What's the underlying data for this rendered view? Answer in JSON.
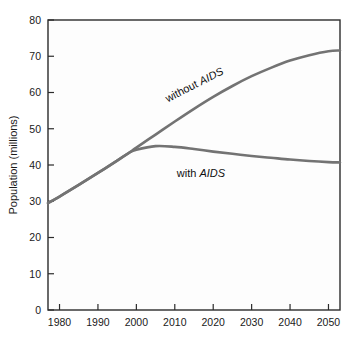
{
  "chart_data": {
    "type": "line",
    "title": "",
    "subtitle": "",
    "xlabel": "",
    "ylabel": "Population (millions)",
    "xlim": [
      1977,
      2053
    ],
    "ylim": [
      0,
      80
    ],
    "grid": false,
    "legend_position": "inline-annotations",
    "x_ticks": [
      1980,
      1990,
      2000,
      2010,
      2020,
      2030,
      2040,
      2050
    ],
    "y_ticks": [
      0,
      10,
      20,
      30,
      40,
      50,
      60,
      70,
      80
    ],
    "x_tick_labels": [
      "1980",
      "1990",
      "2000",
      "2010",
      "2020",
      "2030",
      "2040",
      "2050"
    ],
    "y_tick_labels": [
      "0",
      "10",
      "20",
      "30",
      "40",
      "50",
      "60",
      "70",
      "80"
    ],
    "x": [
      1977,
      1980,
      1985,
      1990,
      1995,
      1998,
      2000,
      2005,
      2010,
      2015,
      2020,
      2025,
      2030,
      2035,
      2040,
      2045,
      2050,
      2053
    ],
    "series": [
      {
        "name": "without AIDS",
        "color": "#737373",
        "values": [
          29.5,
          31.3,
          34.5,
          37.8,
          41.2,
          43.3,
          44.8,
          48.4,
          52.0,
          55.5,
          58.8,
          61.8,
          64.5,
          66.8,
          68.8,
          70.3,
          71.4,
          71.6
        ]
      },
      {
        "name": "with AIDS",
        "color": "#737373",
        "values": [
          29.5,
          31.3,
          34.5,
          37.8,
          41.2,
          43.3,
          44.2,
          45.2,
          45.0,
          44.4,
          43.7,
          43.1,
          42.5,
          42.0,
          41.5,
          41.1,
          40.8,
          40.7
        ]
      }
    ],
    "annotations": [
      {
        "text_plain": "without ",
        "text_italic": "AIDS",
        "full_text": "without AIDS",
        "name": "without-aids-label",
        "x_px": 196,
        "y_px": 88,
        "rotation_deg": -27
      },
      {
        "text_plain": "with ",
        "text_italic": "AIDS",
        "full_text": "with AIDS",
        "name": "with-aids-label",
        "x_px": 201,
        "y_px": 177,
        "rotation_deg": 0
      }
    ],
    "colors": {
      "curve": "#737373",
      "axis": "#2b2b2b",
      "text": "#1a1a1a",
      "plot_background": "#fdfdfd",
      "figure_background": "#ffffff"
    }
  }
}
